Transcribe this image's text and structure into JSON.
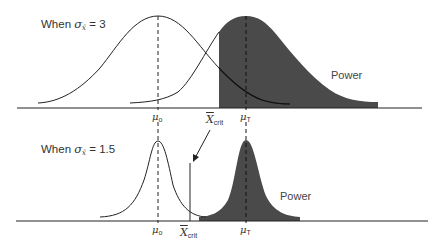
{
  "panels": [
    {
      "title_prefix": "When ",
      "sigma": "σ",
      "sigma_sub": "x̄",
      "title_suffix": " = 3",
      "power_label": "Power",
      "mu0_label": "μ",
      "mu0_sub": "o",
      "muT_label": "μ",
      "muT_sub": "T"
    },
    {
      "title_prefix": "When ",
      "sigma": "σ",
      "sigma_sub": "x̄",
      "title_suffix": " = 1.5",
      "power_label": "Power",
      "mu0_label": "μ",
      "mu0_sub": "o",
      "muT_label": "μ",
      "muT_sub": "T",
      "xcrit_label": "X",
      "xcrit_sub": "crit"
    }
  ],
  "xcrit_arrow_label": "X",
  "xcrit_arrow_sub": "crit",
  "colors": {
    "shade": "#4a4a4a",
    "line": "#222222"
  }
}
